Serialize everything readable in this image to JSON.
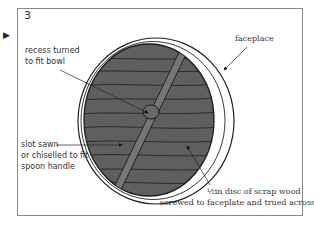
{
  "figure": {
    "step_number": "3",
    "pointer_glyph": "▶",
    "labels": {
      "recess_line1": "recess turned",
      "recess_line2": "to fit bowl",
      "faceplace": "faceplace",
      "slot_line1": "slot sawn",
      "slot_line2": "or chiselled to fit",
      "slot_line3": "spoon handle",
      "disc_line1": "½in disc of scrap wood",
      "disc_line2": "screwed to faceplate and trued across"
    },
    "colors": {
      "disc_fill": "#5f5f5f",
      "ring_fill": "#ffffff",
      "line": "#222222",
      "frame": "#8a8a8a"
    }
  }
}
